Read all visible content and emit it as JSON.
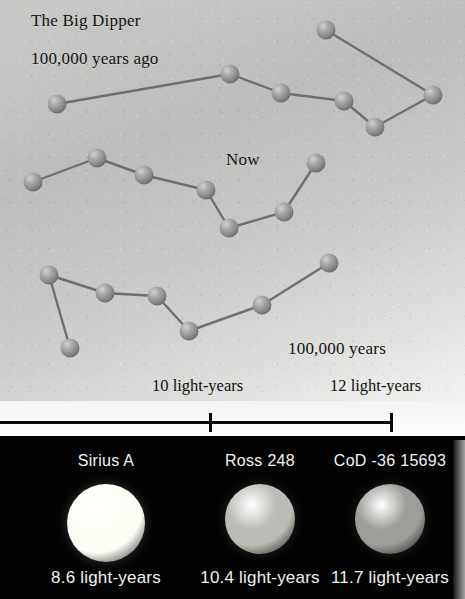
{
  "title": "The Big Dipper",
  "sky": {
    "label_past": "100,000 years ago",
    "label_now": "Now",
    "label_future_line1": "100,000 years",
    "label_future_line2": "in the future",
    "background_top": "#c9c9c7",
    "background_bottom": "#f1f1ef",
    "star_color": "#8d8d8b",
    "link_color": "#6f6f6d"
  },
  "scale": {
    "tick_10_label": "10 light-years",
    "tick_12_label": "12 light-years",
    "line_color": "#0b0b0b"
  },
  "star_panel": {
    "background": "#000000",
    "stars": [
      {
        "name": "Sirius A",
        "distance": "8.6 light-years",
        "color": "#fdfdf6",
        "diameter": 78
      },
      {
        "name": "Ross 248",
        "distance": "10.4 light-years",
        "color": "#bcbcb6",
        "diameter": 70
      },
      {
        "name": "CoD -36 15693",
        "distance": "11.7 light-years",
        "color": "#9d9d99",
        "diameter": 70
      }
    ]
  },
  "chart_data": {
    "type": "scatter",
    "title": "The Big Dipper",
    "xlabel": "",
    "ylabel": "",
    "grid": false,
    "legend_position": "none",
    "annotations": [
      "The Big Dipper",
      "100,000 years ago",
      "Now",
      "100,000 years in the future",
      "10 light-years",
      "12 light-years"
    ],
    "scale_bar": {
      "ticks": [
        10,
        12
      ],
      "tick_labels": [
        "10 light-years",
        "12 light-years"
      ],
      "tick_x_px": [
        210,
        391
      ],
      "bar_x_start_px": 0,
      "bar_x_end_px": 393
    },
    "series": [
      {
        "name": "100,000 years ago",
        "points": [
          [
            57,
            104
          ],
          [
            230,
            74
          ],
          [
            281,
            93
          ],
          [
            344,
            101
          ],
          [
            375,
            127
          ],
          [
            433,
            95
          ],
          [
            326,
            30
          ]
        ],
        "links": [
          [
            0,
            1
          ],
          [
            1,
            2
          ],
          [
            2,
            3
          ],
          [
            3,
            4
          ],
          [
            4,
            5
          ],
          [
            5,
            6
          ]
        ]
      },
      {
        "name": "Now",
        "points": [
          [
            33,
            182
          ],
          [
            97,
            158
          ],
          [
            144,
            175
          ],
          [
            206,
            190
          ],
          [
            229,
            228
          ],
          [
            284,
            212
          ],
          [
            316,
            163
          ]
        ],
        "links": [
          [
            0,
            1
          ],
          [
            1,
            2
          ],
          [
            2,
            3
          ],
          [
            3,
            4
          ],
          [
            4,
            5
          ],
          [
            5,
            6
          ]
        ]
      },
      {
        "name": "100,000 years in the future",
        "points": [
          [
            70,
            348
          ],
          [
            49,
            275
          ],
          [
            105,
            293
          ],
          [
            157,
            296
          ],
          [
            189,
            331
          ],
          [
            262,
            305
          ],
          [
            329,
            263
          ]
        ],
        "links": [
          [
            0,
            1
          ],
          [
            1,
            2
          ],
          [
            2,
            3
          ],
          [
            3,
            4
          ],
          [
            4,
            5
          ],
          [
            5,
            6
          ]
        ]
      }
    ],
    "star_photos": {
      "names": [
        "Sirius A",
        "Ross 248",
        "CoD -36 15693"
      ],
      "distances_ly": [
        8.6,
        10.4,
        11.7
      ],
      "distance_labels": [
        "8.6 light-years",
        "10.4 light-years",
        "11.7 light-years"
      ]
    }
  }
}
